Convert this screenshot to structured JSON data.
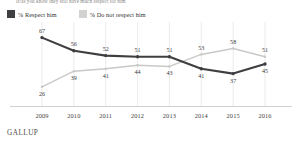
{
  "header": {
    "question": "If/as you know they still have much respect for him"
  },
  "legend": {
    "position": "top-left",
    "items": [
      {
        "label": "% Respect him",
        "color": "#3f3f41",
        "key": "respect"
      },
      {
        "label": "% Do not respect him",
        "color": "#d2d2d0",
        "key": "do_not_respect"
      }
    ]
  },
  "footer": {
    "brand": "GALLUP"
  },
  "chart_data": {
    "type": "line",
    "title": "",
    "subtitle": "",
    "xlabel": "",
    "ylabel": "",
    "grid": "vertical",
    "ylim": [
      20,
      70
    ],
    "categories": [
      "2009",
      "2010",
      "2011",
      "2012",
      "2013",
      "2014",
      "2015",
      "2016"
    ],
    "series": [
      {
        "name": "% Respect him",
        "color": "#3f3f41",
        "values": [
          67,
          56,
          52,
          51,
          51,
          41,
          37,
          45
        ],
        "label_positions": [
          "above",
          "above",
          "above",
          "above",
          "above",
          "below",
          "below",
          "below"
        ]
      },
      {
        "name": "% Do not respect him",
        "color": "#c9c9c7",
        "values": [
          26,
          39,
          41,
          44,
          43,
          53,
          58,
          51
        ],
        "label_positions": [
          "below",
          "below",
          "below",
          "below",
          "below",
          "above",
          "above",
          "above"
        ]
      }
    ]
  }
}
